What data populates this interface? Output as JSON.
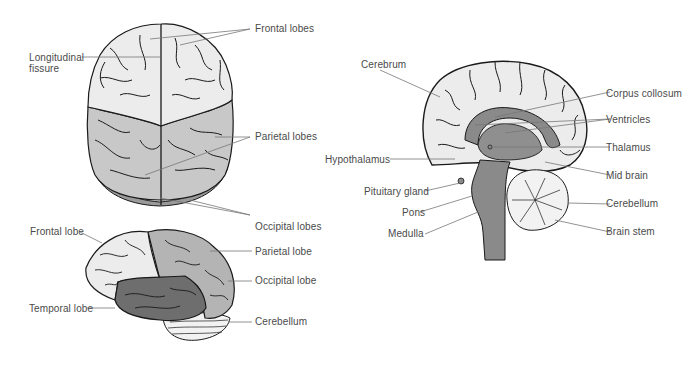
{
  "figure": {
    "type": "brain anatomy illustration",
    "colors": {
      "light_region": "#ececec",
      "mid_region": "#c8c8c8",
      "dark_region": "#9a9a9a",
      "darkest_region": "#6e6e6e",
      "outline": "#1a1a1a",
      "leader_line": "#777777",
      "label_text": "#4a4a4a"
    }
  },
  "top_view": {
    "labels": {
      "longitudinal_fissure": "Longitudinal\nfissure",
      "frontal_lobes": "Frontal lobes",
      "parietal_lobes": "Parietal lobes",
      "occipital_lobes": "Occipital lobes"
    }
  },
  "side_view": {
    "labels": {
      "frontal_lobe": "Frontal lobe",
      "parietal_lobe": "Parietal lobe",
      "occipital_lobe": "Occipital lobe",
      "temporal_lobe": "Temporal lobe",
      "cerebellum": "Cerebellum"
    }
  },
  "sagittal_view": {
    "labels": {
      "cerebrum": "Cerebrum",
      "corpus_collosum": "Corpus collosum",
      "ventricles": "Ventricles",
      "thalamus": "Thalamus",
      "hypothalamus": "Hypothalamus",
      "mid_brain": "Mid brain",
      "pituitary_gland": "Pituitary gland",
      "cerebellum": "Cerebellum",
      "pons": "Pons",
      "brain_stem": "Brain stem",
      "medulla": "Medulla"
    }
  }
}
